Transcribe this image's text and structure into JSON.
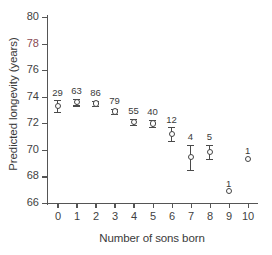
{
  "chart_data": {
    "type": "scatter",
    "title": "",
    "xlabel": "Number of sons born",
    "ylabel": "Predicted longevity (years)",
    "xlim": [
      -0.55,
      10.55
    ],
    "ylim": [
      66,
      80
    ],
    "grid": false,
    "legend": "none",
    "xticks": [
      "0",
      "1",
      "2",
      "3",
      "4",
      "5",
      "6",
      "7",
      "8",
      "9",
      "10"
    ],
    "yticks": [
      "66",
      "68",
      "70",
      "72",
      "74",
      "76",
      "78",
      "80"
    ],
    "x": [
      0,
      1,
      2,
      3,
      4,
      5,
      6,
      7,
      8,
      9,
      10
    ],
    "values": [
      73.3,
      73.6,
      73.5,
      72.9,
      72.1,
      72.0,
      71.2,
      69.45,
      69.85,
      66.9,
      69.35
    ],
    "errors": [
      0.45,
      0.25,
      0.2,
      0.2,
      0.25,
      0.25,
      0.5,
      0.95,
      0.55,
      0,
      0
    ],
    "point_labels": [
      "29",
      "63",
      "86",
      "79",
      "55",
      "40",
      "12",
      "4",
      "5",
      "1",
      "1"
    ],
    "series": [
      {
        "name": "Predicted longevity",
        "values": [
          73.3,
          73.6,
          73.5,
          72.9,
          72.1,
          72.0,
          71.2,
          69.45,
          69.85,
          66.9,
          69.35
        ]
      }
    ],
    "annotations": "Numbers above each point are sample sizes (n)"
  },
  "colors": {
    "axis": "#555555",
    "marker": "#444444",
    "text": "#3a3a3a",
    "accent_tick": "#8a4a52"
  }
}
